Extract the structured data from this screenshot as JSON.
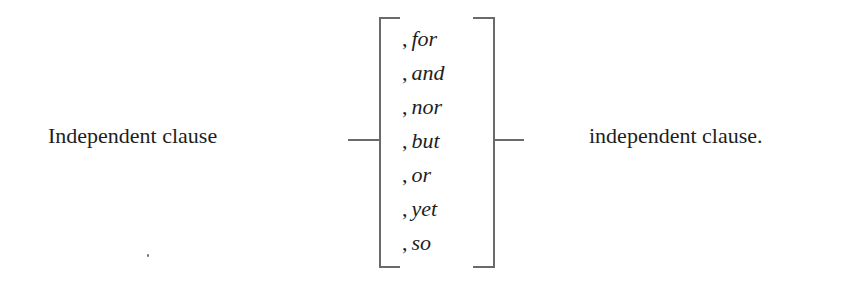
{
  "diagram": {
    "left_clause": "Independent clause",
    "right_clause": "independent clause.",
    "comma": ",",
    "conjunctions": [
      "for",
      "and",
      "nor",
      "but",
      "or",
      "yet",
      "so"
    ]
  }
}
